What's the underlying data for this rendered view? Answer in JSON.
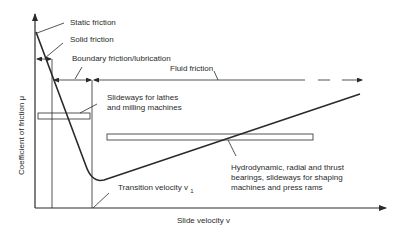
{
  "diagram": {
    "axes": {
      "y_label": "Coefficient of friction μ",
      "x_label": "Slide velocity v"
    },
    "regions": {
      "static": "Static friction",
      "solid": "Solid friction",
      "boundary": "Boundary friction/lubrication",
      "fluid": "Fluid friction"
    },
    "annotations": {
      "transition": "Transition velocity v",
      "transition_sub": "1",
      "slideways_line1": "Slideways for lathes",
      "slideways_line2": "and milling machines",
      "hydro_line1": "Hydrodynamic, radial and thrust",
      "hydro_line2": "bearings, slideways for shaping",
      "hydro_line3": "machines and press rams"
    },
    "colors": {
      "line": "#2a2a2a",
      "background": "#ffffff"
    }
  }
}
